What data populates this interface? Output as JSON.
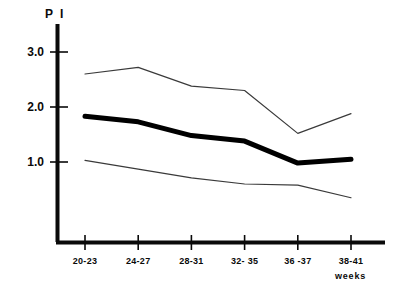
{
  "chart_data": {
    "type": "line",
    "title": "",
    "ylabel": "P I",
    "xlabel": "weeks",
    "categories": [
      "20-23",
      "24-27",
      "28-31",
      "32- 35",
      "36 -37",
      "38-41"
    ],
    "ytick_labels": [
      "3.0",
      "2.0",
      "1.0"
    ],
    "ytick_values": [
      3.0,
      2.0,
      1.0
    ],
    "ylim": [
      0,
      3.35
    ],
    "xlim": [
      0,
      6.6
    ],
    "grid": false,
    "legend": "none",
    "series": [
      {
        "name": "upper",
        "style": "thin",
        "values": [
          2.6,
          2.72,
          2.38,
          2.3,
          1.52,
          1.88
        ]
      },
      {
        "name": "median",
        "style": "bold",
        "values": [
          1.83,
          1.73,
          1.48,
          1.38,
          0.98,
          1.05
        ]
      },
      {
        "name": "lower",
        "style": "thin",
        "values": [
          1.03,
          0.87,
          0.71,
          0.6,
          0.58,
          0.35
        ]
      }
    ],
    "colors": {
      "axis": "#0a0a0a",
      "bold_line": "#000000",
      "thin_line": "#3a3a3a",
      "background": "#ffffff"
    }
  }
}
